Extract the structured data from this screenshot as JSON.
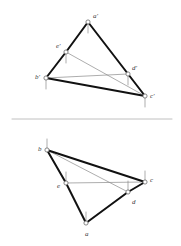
{
  "figure": {
    "title": "",
    "background_color": "#ffffff",
    "stroke_thick_color": "#111111",
    "stroke_thin_color": "#8a8a8a",
    "divider_color": "#b0b0b0",
    "node_fill": "#ffffff",
    "node_stroke": "#6b6b6b",
    "label_color": "#3a3a3a"
  },
  "views": [
    {
      "name": "front-view",
      "points": [
        {
          "id": "a-prime",
          "label": "a'",
          "x": 88,
          "y": 22,
          "label_dx": 5,
          "label_dy": -9,
          "tick_dir": "down"
        },
        {
          "id": "e-prime",
          "label": "e'",
          "x": 66,
          "y": 52,
          "label_dx": -10,
          "label_dy": -9,
          "tick_dir": "down"
        },
        {
          "id": "b-prime",
          "label": "b'",
          "x": 46,
          "y": 78,
          "label_dx": -11,
          "label_dy": -4,
          "tick_dir": "down"
        },
        {
          "id": "d-prime",
          "label": "d'",
          "x": 128,
          "y": 74,
          "label_dx": 4,
          "label_dy": -9,
          "tick_dir": "down"
        },
        {
          "id": "c-prime",
          "label": "c'",
          "x": 145,
          "y": 96,
          "label_dx": 5,
          "label_dy": -3,
          "tick_dir": "down"
        }
      ],
      "thick_edges": [
        {
          "from": "a-prime",
          "to": "e-prime"
        },
        {
          "from": "e-prime",
          "to": "b-prime"
        },
        {
          "from": "a-prime",
          "to": "c-prime"
        },
        {
          "from": "b-prime",
          "to": "c-prime"
        }
      ],
      "thin_edges": [
        {
          "from": "e-prime",
          "to": "c-prime"
        },
        {
          "from": "b-prime",
          "to": "d-prime"
        },
        {
          "from": "d-prime",
          "to": "c-prime"
        }
      ]
    },
    {
      "name": "top-view",
      "points": [
        {
          "id": "b",
          "label": "b",
          "x": 47,
          "y": 150,
          "label_dx": -9,
          "label_dy": -4,
          "tick_dir": "up"
        },
        {
          "id": "e",
          "label": "e",
          "x": 66,
          "y": 183,
          "label_dx": -9,
          "label_dy": 0,
          "tick_dir": "up"
        },
        {
          "id": "c",
          "label": "c",
          "x": 145,
          "y": 182,
          "label_dx": 5,
          "label_dy": -5,
          "tick_dir": "up"
        },
        {
          "id": "d",
          "label": "d",
          "x": 128,
          "y": 192,
          "label_dx": 4,
          "label_dy": 7,
          "tick_dir": "up"
        },
        {
          "id": "a",
          "label": "a",
          "x": 86,
          "y": 223,
          "label_dx": -1,
          "label_dy": 8,
          "tick_dir": "up"
        }
      ],
      "thick_edges": [
        {
          "from": "b",
          "to": "e"
        },
        {
          "from": "e",
          "to": "a"
        },
        {
          "from": "b",
          "to": "c"
        },
        {
          "from": "a",
          "to": "d"
        },
        {
          "from": "d",
          "to": "c"
        }
      ],
      "thin_edges": [
        {
          "from": "e",
          "to": "c"
        },
        {
          "from": "b",
          "to": "d"
        }
      ]
    }
  ],
  "divider": {
    "x1": 12,
    "y1": 119,
    "x2": 172,
    "y2": 119
  },
  "geometry": {
    "tick_length": 11,
    "node_radius": 2.1,
    "thick_width": 2.0,
    "thin_width": 0.7,
    "tick_width": 0.7
  }
}
